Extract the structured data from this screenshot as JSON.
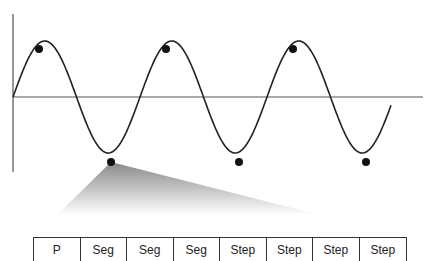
{
  "diagram": {
    "type": "waveform-segmentation",
    "axes": {
      "origin": [
        13,
        97
      ],
      "vertical_axis": {
        "x": 13,
        "y_top": 14,
        "y_bottom": 172
      },
      "horizontal_axis": {
        "y": 97,
        "x_start": 13,
        "x_end": 423
      },
      "color": "#555555"
    },
    "wave": {
      "shape": "sine",
      "x_start": 13,
      "x_end": 391,
      "period_px": 127,
      "amplitude_px": 56,
      "color": "#222222",
      "peaks": [
        [
          39,
          49
        ],
        [
          166,
          49
        ],
        [
          293,
          49
        ]
      ],
      "troughs": [
        [
          111,
          162
        ],
        [
          239,
          162
        ],
        [
          366,
          162
        ]
      ]
    },
    "markers": {
      "count": 6,
      "color": "#111111",
      "radius": 4
    },
    "zoom_wedge": {
      "apex": [
        111,
        162
      ],
      "base_left": [
        57,
        215
      ],
      "base_right": [
        320,
        215
      ],
      "color_top": "#888888",
      "color_bottom": "#ffffff"
    }
  },
  "segments": {
    "cells": [
      {
        "label": "P"
      },
      {
        "label": "Seg"
      },
      {
        "label": "Seg"
      },
      {
        "label": "Seg"
      },
      {
        "label": "Step"
      },
      {
        "label": "Step"
      },
      {
        "label": "Step"
      },
      {
        "label": "Step"
      }
    ]
  }
}
